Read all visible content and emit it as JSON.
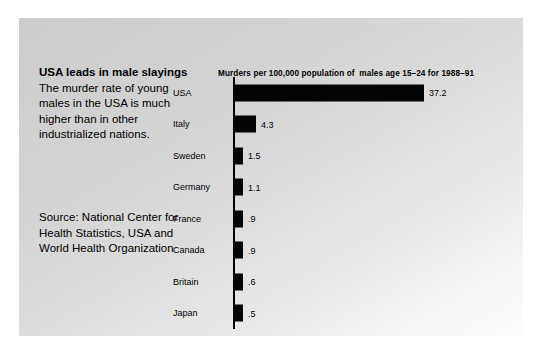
{
  "figure": {
    "headline": "USA leads in male slayings",
    "deck": "The murder rate of young males in the USA is much higher than in other industrialized nations.",
    "source": "Source: National Center for Health Statistics, USA and World Health Organization"
  },
  "chart_data": {
    "type": "bar",
    "orientation": "horizontal",
    "title": "Murders per 100,000 population of  males age 15–24 for 1988–91",
    "xlabel": "",
    "ylabel": "",
    "categories": [
      "USA",
      "Italy",
      "Sweden",
      "Germany",
      "France",
      "Canada",
      "Britain",
      "Japan"
    ],
    "values": [
      37.2,
      4.3,
      1.5,
      1.1,
      0.9,
      0.9,
      0.6,
      0.5
    ],
    "value_labels": [
      "37.2",
      "4.3",
      "1.5",
      "1.1",
      ".9",
      ".9",
      ".6",
      ".5"
    ],
    "xlim": [
      0,
      37.2
    ],
    "grid": false,
    "legend": null,
    "bar_color": "#050505",
    "background_color": "#d8d8d8"
  }
}
